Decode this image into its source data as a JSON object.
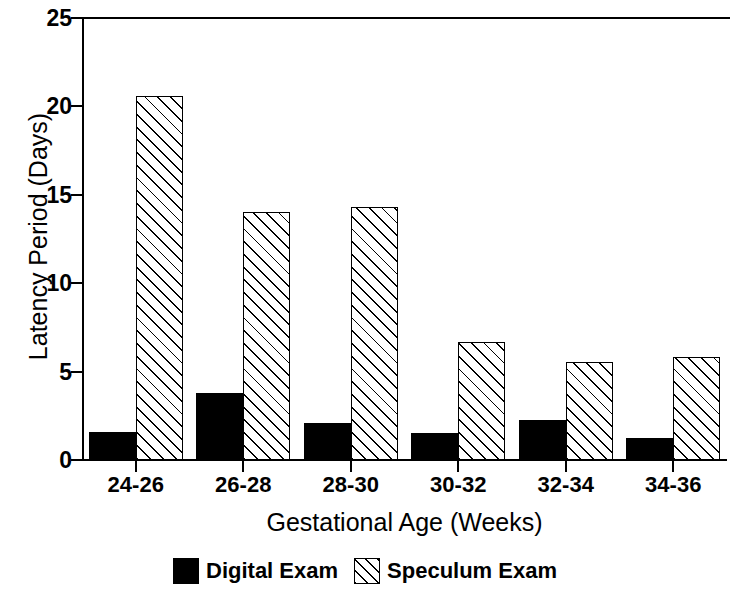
{
  "chart_data": {
    "type": "bar",
    "title": "",
    "subtitle": "",
    "xlabel": "Gestational Age (Weeks)",
    "ylabel": "Latency Period (Days)",
    "categories": [
      "24-26",
      "26-28",
      "28-30",
      "30-32",
      "32-34",
      "34-36"
    ],
    "series": [
      {
        "name": "Digital Exam",
        "fill": "solid-black",
        "color": "#000000",
        "values": [
          1.6,
          3.8,
          2.1,
          1.5,
          2.25,
          1.25
        ]
      },
      {
        "name": "Speculum Exam",
        "fill": "diagonal-hatch",
        "color": "#000000",
        "values": [
          20.6,
          14.0,
          14.3,
          6.7,
          5.55,
          5.85
        ]
      }
    ],
    "ylim": [
      0,
      25
    ],
    "yticks": [
      0,
      5,
      10,
      15,
      20,
      25
    ],
    "ytick_labels": [
      "0",
      "5",
      "10",
      "15",
      "20",
      "25"
    ],
    "grid": false,
    "legend_position": "bottom-center",
    "axis_color": "#000000",
    "background_color": "#ffffff"
  }
}
